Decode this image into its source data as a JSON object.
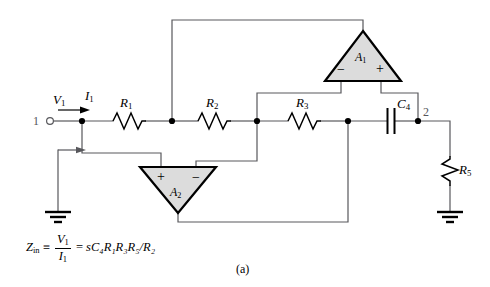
{
  "figure": {
    "caption": "(a)",
    "title": ""
  },
  "terminals": [
    {
      "name": "terminal-1",
      "label": "1",
      "x": 40,
      "y": 122
    },
    {
      "name": "terminal-2",
      "label": "2",
      "x": 422,
      "y": 116
    }
  ],
  "signals": {
    "voltage_label": "V",
    "voltage_sub": "1",
    "current_label": "I",
    "current_sub": "1"
  },
  "components": [
    {
      "name": "resistor-r1",
      "label": "R",
      "sub": "1",
      "type": "resistor",
      "orientation": "horizontal"
    },
    {
      "name": "resistor-r2",
      "label": "R",
      "sub": "2",
      "type": "resistor",
      "orientation": "horizontal"
    },
    {
      "name": "resistor-r3",
      "label": "R",
      "sub": "3",
      "type": "resistor",
      "orientation": "horizontal"
    },
    {
      "name": "capacitor-c4",
      "label": "C",
      "sub": "4",
      "type": "capacitor",
      "orientation": "horizontal"
    },
    {
      "name": "resistor-r5",
      "label": "R",
      "sub": "5",
      "type": "resistor",
      "orientation": "vertical"
    }
  ],
  "opamps": [
    {
      "name": "opamp-a1",
      "label": "A",
      "sub": "1",
      "orientation": "up",
      "inputs": [
        {
          "polarity": "−",
          "side": "left"
        },
        {
          "polarity": "+",
          "side": "right"
        }
      ]
    },
    {
      "name": "opamp-a2",
      "label": "A",
      "sub": "2",
      "orientation": "down",
      "inputs": [
        {
          "polarity": "+",
          "side": "left"
        },
        {
          "polarity": "−",
          "side": "right"
        }
      ]
    }
  ],
  "equation": {
    "lhs_symbol": "Z",
    "lhs_sub": "in",
    "identity": "≡",
    "fraction_num": "V",
    "fraction_num_sub": "1",
    "fraction_den": "I",
    "fraction_den_sub": "1",
    "equals": "=",
    "rhs": "sC₄R₁R₃R₅/R₂",
    "rhs_plain": "sC4R1R3R5/R2"
  },
  "colors": {
    "wire": "#58585c",
    "component": "#000000",
    "opamp_fill": "#dcdcdc",
    "opamp_stroke": "#000000",
    "node_dot": "#000000",
    "background": "#ffffff",
    "node_label": "#55555a"
  },
  "labels": {
    "r1": "R1",
    "r2": "R2",
    "r3": "R3",
    "c4": "C4",
    "r5": "R5",
    "a1": "A1",
    "a2": "A2",
    "ground": "ground-symbol",
    "zin_arrow": "zin-direction-arrow"
  }
}
